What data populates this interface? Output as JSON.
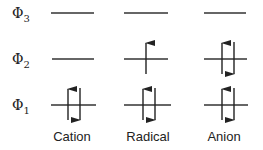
{
  "diagram": {
    "levels": [
      {
        "symbol": "Φ",
        "subscript": "3",
        "y": 13
      },
      {
        "symbol": "Φ",
        "subscript": "2",
        "y": 59
      },
      {
        "symbol": "Φ",
        "subscript": "1",
        "y": 105
      }
    ],
    "columns": [
      {
        "label": "Cation",
        "x1": 51,
        "x2": 94,
        "occupancy": {
          "phi1": "up-down",
          "phi2": "empty",
          "phi3": "empty"
        }
      },
      {
        "label": "Radical",
        "x1": 124,
        "x2": 168,
        "occupancy": {
          "phi1": "up-down",
          "phi2": "up",
          "phi3": "empty"
        }
      },
      {
        "label": "Anion",
        "x1": 204,
        "x2": 246,
        "occupancy": {
          "phi1": "up-down",
          "phi2": "up-down",
          "phi3": "empty"
        }
      }
    ],
    "line_color": "#333333"
  }
}
